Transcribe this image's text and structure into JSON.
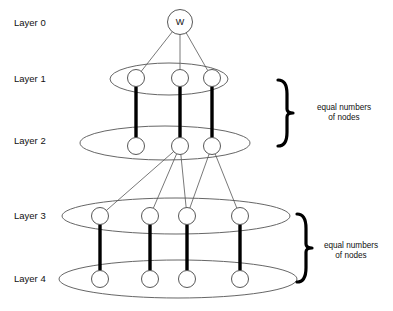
{
  "diagram": {
    "background_color": "#ffffff",
    "stroke_color": "#555555",
    "thick_stroke_color": "#000000",
    "node_fill": "#ffffff",
    "text_color": "#111111",
    "width": 393,
    "height": 311
  },
  "layer_labels": [
    {
      "id": "layer-0",
      "text": "Layer 0",
      "x": 14,
      "y": 26
    },
    {
      "id": "layer-1",
      "text": "Layer 1",
      "x": 14,
      "y": 82
    },
    {
      "id": "layer-2",
      "text": "Layer 2",
      "x": 14,
      "y": 144
    },
    {
      "id": "layer-3",
      "text": "Layer 3",
      "x": 14,
      "y": 219
    },
    {
      "id": "layer-4",
      "text": "Layer 4",
      "x": 14,
      "y": 282
    }
  ],
  "plates": [
    {
      "id": "plate-layer-1",
      "cx": 169,
      "cy": 79,
      "rx": 59,
      "ry": 16
    },
    {
      "id": "plate-layer-2",
      "cx": 165,
      "cy": 143,
      "rx": 85,
      "ry": 17
    },
    {
      "id": "plate-layer-3",
      "cx": 176,
      "cy": 216,
      "rx": 114,
      "ry": 18
    },
    {
      "id": "plate-layer-4",
      "cx": 178,
      "cy": 279,
      "rx": 119,
      "ry": 19
    }
  ],
  "nodes": [
    {
      "id": "n-w",
      "layer": 0,
      "label": "W",
      "cx": 180,
      "cy": 22,
      "r": 12.5
    },
    {
      "id": "n-1-1",
      "layer": 1,
      "label": "",
      "cx": 136,
      "cy": 78,
      "r": 8.5
    },
    {
      "id": "n-1-2",
      "layer": 1,
      "label": "",
      "cx": 180,
      "cy": 78,
      "r": 8.5
    },
    {
      "id": "n-1-3",
      "layer": 1,
      "label": "",
      "cx": 212,
      "cy": 78,
      "r": 8.5
    },
    {
      "id": "n-2-1",
      "layer": 2,
      "label": "",
      "cx": 136,
      "cy": 146,
      "r": 8.5
    },
    {
      "id": "n-2-2",
      "layer": 2,
      "label": "",
      "cx": 180,
      "cy": 146,
      "r": 8.5
    },
    {
      "id": "n-2-3",
      "layer": 2,
      "label": "",
      "cx": 212,
      "cy": 146,
      "r": 8.5
    },
    {
      "id": "n-3-1",
      "layer": 3,
      "label": "",
      "cx": 100,
      "cy": 216,
      "r": 8.5
    },
    {
      "id": "n-3-2",
      "layer": 3,
      "label": "",
      "cx": 150,
      "cy": 216,
      "r": 8.5
    },
    {
      "id": "n-3-3",
      "layer": 3,
      "label": "",
      "cx": 187,
      "cy": 216,
      "r": 8.5
    },
    {
      "id": "n-3-4",
      "layer": 3,
      "label": "",
      "cx": 240,
      "cy": 216,
      "r": 8.5
    },
    {
      "id": "n-4-1",
      "layer": 4,
      "label": "",
      "cx": 100,
      "cy": 279,
      "r": 8.5
    },
    {
      "id": "n-4-2",
      "layer": 4,
      "label": "",
      "cx": 150,
      "cy": 279,
      "r": 8.5
    },
    {
      "id": "n-4-3",
      "layer": 4,
      "label": "",
      "cx": 187,
      "cy": 279,
      "r": 8.5
    },
    {
      "id": "n-4-4",
      "layer": 4,
      "label": "",
      "cx": 240,
      "cy": 279,
      "r": 8.5
    }
  ],
  "thin_edges": [
    {
      "id": "e-w-11",
      "from": "n-w",
      "to": "n-1-1"
    },
    {
      "id": "e-w-12",
      "from": "n-w",
      "to": "n-1-2"
    },
    {
      "id": "e-w-13",
      "from": "n-w",
      "to": "n-1-3"
    },
    {
      "id": "e-22-31",
      "from": "n-2-2",
      "to": "n-3-1"
    },
    {
      "id": "e-22-32",
      "from": "n-2-2",
      "to": "n-3-2"
    },
    {
      "id": "e-22-33",
      "from": "n-2-2",
      "to": "n-3-3"
    },
    {
      "id": "e-23-33",
      "from": "n-2-3",
      "to": "n-3-3"
    },
    {
      "id": "e-23-34",
      "from": "n-2-3",
      "to": "n-3-4"
    }
  ],
  "thick_edges": [
    {
      "id": "t-11-21",
      "from": "n-1-1",
      "to": "n-2-1"
    },
    {
      "id": "t-12-22",
      "from": "n-1-2",
      "to": "n-2-2"
    },
    {
      "id": "t-13-23",
      "from": "n-1-3",
      "to": "n-2-3"
    },
    {
      "id": "t-31-41",
      "from": "n-3-1",
      "to": "n-4-1"
    },
    {
      "id": "t-32-42",
      "from": "n-3-2",
      "to": "n-4-2"
    },
    {
      "id": "t-33-43",
      "from": "n-3-3",
      "to": "n-4-3"
    },
    {
      "id": "t-34-44",
      "from": "n-3-4",
      "to": "n-4-4"
    }
  ],
  "annotations": [
    {
      "id": "annotation-upper",
      "line1": "equal numbers",
      "line2": "of nodes",
      "text_x": 344,
      "text_y": 110,
      "brace_x": 287,
      "brace_top": 80,
      "brace_bottom": 146
    },
    {
      "id": "annotation-lower",
      "line1": "equal numbers",
      "line2": "of nodes",
      "text_x": 351,
      "text_y": 248,
      "brace_x": 306,
      "brace_top": 214,
      "brace_bottom": 282
    }
  ]
}
